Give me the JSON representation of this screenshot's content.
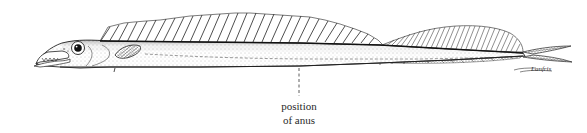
{
  "figure": {
    "annotation": {
      "line1": "position",
      "line2": "of anus"
    },
    "signature": "Lanfris",
    "colors": {
      "ink": "#1a1a1a",
      "shading": "#9a9a9a",
      "background": "#ffffff"
    }
  }
}
